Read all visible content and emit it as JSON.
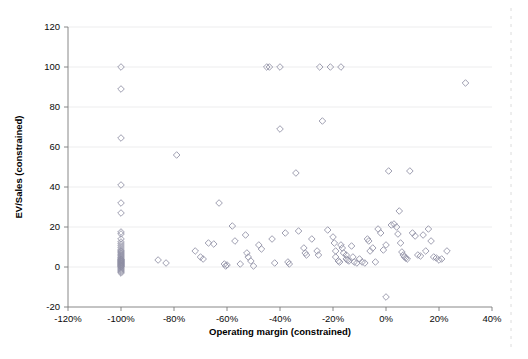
{
  "chart_data": {
    "type": "scatter",
    "title": "",
    "xlabel": "Operating margin (constrained)",
    "ylabel": "EV/Sales (constrained)",
    "xlim": [
      -120,
      40
    ],
    "ylim": [
      -20,
      120
    ],
    "xtick_labels": [
      "-120%",
      "-100%",
      "-80%",
      "-60%",
      "-40%",
      "-20%",
      "0%",
      "20%",
      "40%"
    ],
    "xtick_values": [
      -120,
      -100,
      -80,
      -60,
      -40,
      -20,
      0,
      20,
      40
    ],
    "ytick_labels": [
      "-20",
      "0",
      "20",
      "40",
      "60",
      "80",
      "100",
      "120"
    ],
    "ytick_values": [
      -20,
      0,
      20,
      40,
      60,
      80,
      100,
      120
    ],
    "grid": true,
    "grid_axis": "y",
    "legend": false,
    "marker": "diamond-open",
    "marker_color": "#8e8ea3",
    "series": [
      {
        "name": "companies",
        "points": [
          [
            -100,
            100
          ],
          [
            -100,
            89
          ],
          [
            -100,
            64.5
          ],
          [
            -100,
            41
          ],
          [
            -100,
            32
          ],
          [
            -100,
            27
          ],
          [
            -100,
            17.5
          ],
          [
            -100,
            16.5
          ],
          [
            -100,
            14
          ],
          [
            -100,
            12.5
          ],
          [
            -100,
            11.5
          ],
          [
            -100,
            10.5
          ],
          [
            -100,
            9.5
          ],
          [
            -100,
            8.5
          ],
          [
            -100,
            8
          ],
          [
            -100,
            7.5
          ],
          [
            -100,
            7
          ],
          [
            -100,
            6.5
          ],
          [
            -100,
            6
          ],
          [
            -100,
            5.5
          ],
          [
            -100,
            5
          ],
          [
            -100,
            4.5
          ],
          [
            -100,
            4
          ],
          [
            -100,
            3.8
          ],
          [
            -100,
            3.5
          ],
          [
            -100,
            3.2
          ],
          [
            -100,
            3
          ],
          [
            -100,
            2.8
          ],
          [
            -100,
            2.5
          ],
          [
            -100,
            2.2
          ],
          [
            -100,
            2
          ],
          [
            -100,
            1.8
          ],
          [
            -100,
            1.5
          ],
          [
            -100,
            1.2
          ],
          [
            -100,
            1
          ],
          [
            -100,
            0.8
          ],
          [
            -100,
            0.5
          ],
          [
            -100,
            0.2
          ],
          [
            -100,
            0
          ],
          [
            -100,
            -0.5
          ],
          [
            -100,
            -1
          ],
          [
            -100,
            -1.5
          ],
          [
            -100,
            -2
          ],
          [
            -100,
            -2.5
          ],
          [
            -100,
            -3
          ],
          [
            -86,
            3.5
          ],
          [
            -83,
            2
          ],
          [
            -79,
            56
          ],
          [
            -72,
            8
          ],
          [
            -70,
            5
          ],
          [
            -69,
            4
          ],
          [
            -67,
            12
          ],
          [
            -65,
            11.5
          ],
          [
            -63,
            32
          ],
          [
            -61,
            1.5
          ],
          [
            -60.5,
            0.5
          ],
          [
            -60,
            1
          ],
          [
            -58,
            20.5
          ],
          [
            -57,
            13
          ],
          [
            -55,
            1.5
          ],
          [
            -53,
            16
          ],
          [
            -52.5,
            7
          ],
          [
            -52,
            5
          ],
          [
            -51,
            3
          ],
          [
            -50,
            0.5
          ],
          [
            -48,
            11
          ],
          [
            -47,
            9
          ],
          [
            -45,
            100
          ],
          [
            -44,
            100
          ],
          [
            -43,
            14
          ],
          [
            -42,
            2
          ],
          [
            -40,
            100
          ],
          [
            -40,
            69
          ],
          [
            -38,
            17
          ],
          [
            -37,
            2.5
          ],
          [
            -36.5,
            1.5
          ],
          [
            -34,
            47
          ],
          [
            -33,
            18
          ],
          [
            -31,
            9.5
          ],
          [
            -30.5,
            7
          ],
          [
            -30,
            6
          ],
          [
            -28,
            14
          ],
          [
            -26,
            8
          ],
          [
            -25.5,
            6
          ],
          [
            -25,
            100
          ],
          [
            -24,
            73
          ],
          [
            -22,
            18.5
          ],
          [
            -21,
            100
          ],
          [
            -20,
            15
          ],
          [
            -19.5,
            12
          ],
          [
            -19,
            8
          ],
          [
            -19,
            5
          ],
          [
            -18,
            3
          ],
          [
            -17.5,
            2.5
          ],
          [
            -17,
            100
          ],
          [
            -17,
            11
          ],
          [
            -16.5,
            9.5
          ],
          [
            -16,
            7
          ],
          [
            -15,
            6
          ],
          [
            -15,
            4
          ],
          [
            -14.5,
            3.5
          ],
          [
            -14,
            3
          ],
          [
            -13,
            10.5
          ],
          [
            -12.5,
            5
          ],
          [
            -12,
            2.5
          ],
          [
            -11,
            2
          ],
          [
            -10,
            4
          ],
          [
            -9,
            2.5
          ],
          [
            -8,
            2
          ],
          [
            -7,
            14
          ],
          [
            -6.5,
            13
          ],
          [
            -6,
            8
          ],
          [
            -5,
            9.5
          ],
          [
            -4,
            2.5
          ],
          [
            -3,
            19
          ],
          [
            -2,
            17
          ],
          [
            -1,
            8.5
          ],
          [
            0,
            11
          ],
          [
            0,
            -15
          ],
          [
            1,
            48
          ],
          [
            2,
            21
          ],
          [
            3,
            21.5
          ],
          [
            4,
            20
          ],
          [
            4.5,
            16.5
          ],
          [
            5,
            28
          ],
          [
            5.5,
            12
          ],
          [
            6,
            7.5
          ],
          [
            6.5,
            6
          ],
          [
            7,
            5
          ],
          [
            7.5,
            4.5
          ],
          [
            8,
            4
          ],
          [
            9,
            48
          ],
          [
            10,
            17
          ],
          [
            11,
            15.5
          ],
          [
            12,
            6
          ],
          [
            13,
            5.5
          ],
          [
            14,
            16
          ],
          [
            15,
            8
          ],
          [
            16,
            19
          ],
          [
            17,
            13
          ],
          [
            18,
            5
          ],
          [
            19,
            4.5
          ],
          [
            20,
            3.5
          ],
          [
            21,
            4
          ],
          [
            23,
            8
          ],
          [
            30,
            92
          ]
        ]
      }
    ]
  }
}
